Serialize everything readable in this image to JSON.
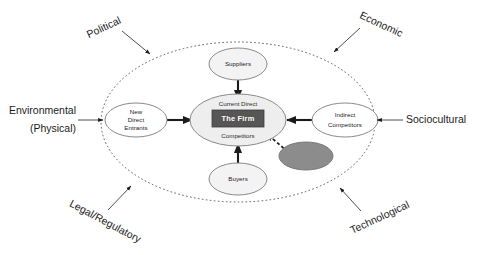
{
  "diagram": {
    "colors": {
      "firm_box_fill": "#565656",
      "firm_box_text": "#ffffff",
      "center_ellipse_fill": "#eeeeee",
      "node_ellipse_fill": "#f3f3f3",
      "complementors_fill": "#8c8c8c",
      "outline": "#8a8a8a",
      "arrow": "#1b1b1b",
      "background": "#ffffff"
    },
    "boundary": {
      "name": "industry-boundary-ellipse",
      "style": "dotted"
    },
    "center": {
      "line_top": "Current Direct",
      "firm": "The Firm",
      "line_bottom": "Competitors"
    },
    "forces": [
      {
        "id": "suppliers",
        "label": "Suppliers",
        "position": "top",
        "arrow_to_center": true
      },
      {
        "id": "new-direct-entrants",
        "label": "New\nDirect\nEntrants",
        "lines": [
          "New",
          "Direct",
          "Entrants"
        ],
        "position": "left",
        "arrow_to_center": true
      },
      {
        "id": "indirect-competitors",
        "label": "Indirect\nCompetitors",
        "lines": [
          "Indirect",
          "Competitors"
        ],
        "position": "right",
        "arrow_to_center": true
      },
      {
        "id": "buyers",
        "label": "Buyers",
        "position": "bottom",
        "arrow_to_center": true
      },
      {
        "id": "complementors",
        "label": "Complementors",
        "lines": [
          "Complementors"
        ],
        "position": "bottom-right",
        "arrow_to_center": true,
        "arrow_style": "dashed",
        "shaded": true
      }
    ],
    "external_factors": [
      {
        "id": "political",
        "label": "Political",
        "position": "top-left",
        "rotation": -25
      },
      {
        "id": "economic",
        "label": "Economic",
        "position": "top-right",
        "rotation": 25
      },
      {
        "id": "environmental-physical",
        "label": "Environmental\n(Physical)",
        "lines": [
          "Environmental",
          "(Physical)"
        ],
        "position": "left",
        "rotation": 0
      },
      {
        "id": "sociocultural",
        "label": "Sociocultural",
        "position": "right",
        "rotation": 0
      },
      {
        "id": "legal-regulatory",
        "label": "Legal/Regulatory",
        "position": "bottom-left",
        "rotation": 28
      },
      {
        "id": "technological",
        "label": "Technological",
        "position": "bottom-right",
        "rotation": -25
      }
    ]
  }
}
